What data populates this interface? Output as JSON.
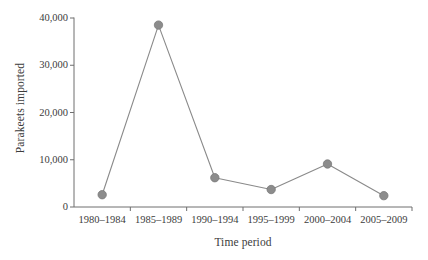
{
  "chart_data": {
    "type": "line",
    "title": "",
    "xlabel": "Time period",
    "ylabel": "Parakeets imported",
    "categories": [
      "1980–1984",
      "1985–1989",
      "1990–1994",
      "1995–1999",
      "2000–2004",
      "2005–2009"
    ],
    "values": [
      2600,
      38500,
      6200,
      3700,
      9100,
      2400
    ],
    "series": [
      {
        "name": "Parakeets imported",
        "values": [
          2600,
          38500,
          6200,
          3700,
          9100,
          2400
        ]
      }
    ],
    "ylim": [
      0,
      40000
    ],
    "xlim_categories": 6,
    "ytick_values": [
      0,
      10000,
      20000,
      30000,
      40000
    ],
    "ytick_labels": [
      "0",
      "10,000",
      "20,000",
      "30,000",
      "40,000"
    ],
    "grid": false,
    "legend": false,
    "legend_position": "none",
    "marker": "circle",
    "marker_color": "#8c8c8c",
    "line_color": "#8a8a8a",
    "axis_color": "#6e6e6e",
    "background_color": "#ffffff",
    "text_color": "#3c3c3c"
  }
}
